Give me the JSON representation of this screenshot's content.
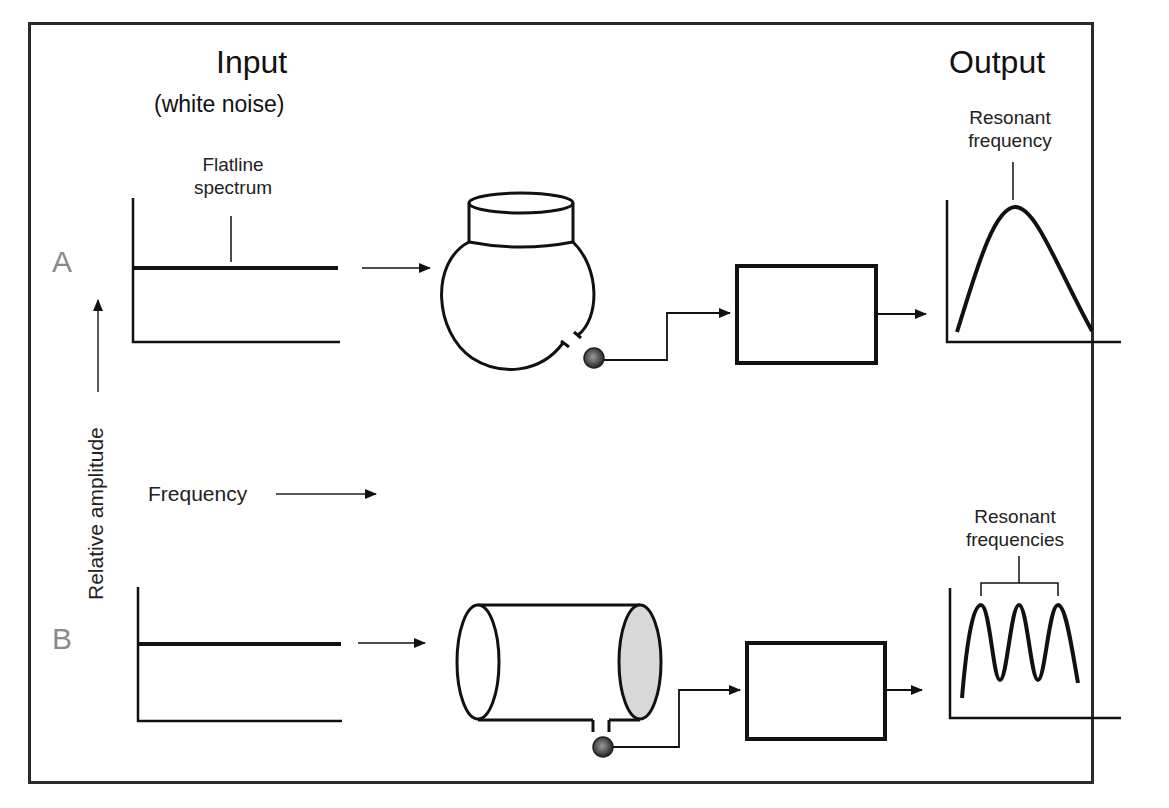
{
  "headers": {
    "input_title": "Input",
    "input_subtitle": "(white noise)",
    "output_title": "Output"
  },
  "rows": {
    "a_label": "A",
    "b_label": "B"
  },
  "axes": {
    "y_label": "Relative amplitude",
    "x_label": "Frequency"
  },
  "annotations": {
    "input_a": "Flatline\nspectrum",
    "input_a_line1": "Flatline",
    "input_a_line2": "spectrum",
    "output_a_line1": "Resonant",
    "output_a_line2": "frequency",
    "output_b_line1": "Resonant",
    "output_b_line2": "frequencies"
  },
  "processors": {
    "a_label": "Computer",
    "b_label": "Computer"
  },
  "resonators": {
    "a": "flask-shaped resonator (sphere with neck)",
    "b": "cylindrical tube resonator"
  },
  "colors": {
    "line": "#111111",
    "row_letter": "#8a8a8a",
    "tube_end_fill": "#d8d8d8",
    "microphone": "#555555"
  }
}
